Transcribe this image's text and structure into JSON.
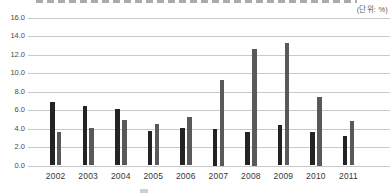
{
  "unit_label": "(단위: %)",
  "chart_data": {
    "type": "bar",
    "title": "",
    "unit_label": "(단위: %)",
    "categories": [
      "2002",
      "2003",
      "2004",
      "2005",
      "2006",
      "2007",
      "2008",
      "2009",
      "2010",
      "2011"
    ],
    "series": [
      {
        "name": "dark-bars",
        "color": "#232323",
        "values": [
          6.9,
          6.4,
          6.1,
          3.7,
          4.1,
          4.0,
          3.6,
          4.4,
          3.6,
          3.2
        ]
      },
      {
        "name": "gray-bars",
        "color": "#59595c",
        "values": [
          3.6,
          4.1,
          4.9,
          4.5,
          5.2,
          9.3,
          12.6,
          13.2,
          7.4,
          4.8
        ]
      }
    ],
    "xlabel": "",
    "ylabel": "",
    "ylim": [
      0,
      16
    ],
    "ytick_step": 2,
    "ytick_labels": [
      "0.0",
      "2.0",
      "4.0",
      "6.0",
      "8.0",
      "10.0",
      "12.0",
      "14.0",
      "16.0"
    ],
    "grid": true,
    "gridline_color": "#c9c9c9",
    "legend_position": "bottom (cut off)"
  }
}
